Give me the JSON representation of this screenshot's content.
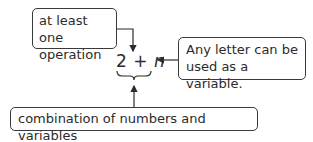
{
  "diagram": {
    "expression": {
      "number": "2",
      "operator": "+",
      "variable": "n"
    },
    "callouts": [
      {
        "id": "operation",
        "text_lines": [
          "at least one",
          "operation"
        ],
        "points_to": "operator"
      },
      {
        "id": "variable",
        "text_lines": [
          "Any letter can be",
          "used as a variable."
        ],
        "points_to": "variable"
      },
      {
        "id": "combination",
        "text_lines": [
          "combination of numbers and variables"
        ],
        "points_to": "whole expression (brace)"
      }
    ],
    "colors": {
      "stroke": "#3a3a3a",
      "text": "#2b2b2b",
      "background": "#ffffff"
    }
  }
}
